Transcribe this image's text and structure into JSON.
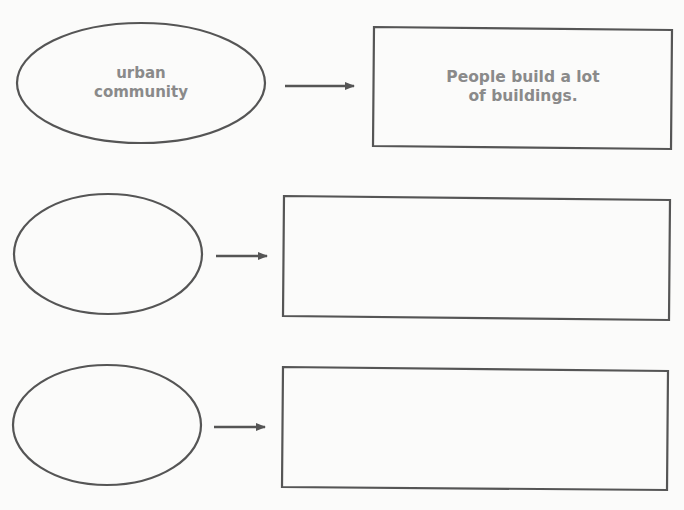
{
  "colors": {
    "stroke": "#555555",
    "text": "#8a8a8a",
    "background": "#fbfbfa"
  },
  "rows": [
    {
      "cause": {
        "lines": [
          "urban",
          "community"
        ]
      },
      "effect": {
        "lines": [
          "People build a lot",
          "of buildings."
        ]
      }
    },
    {
      "cause": {
        "lines": []
      },
      "effect": {
        "lines": []
      }
    },
    {
      "cause": {
        "lines": []
      },
      "effect": {
        "lines": []
      }
    }
  ]
}
